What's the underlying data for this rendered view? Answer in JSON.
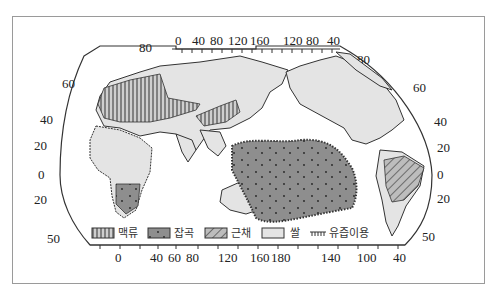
{
  "map": {
    "title": "",
    "projection": "interrupted world map (Eurasia/Africa/Oceania left, Americas right)",
    "top_longitude_ticks_left": [
      "0",
      "40",
      "80",
      "120",
      "160"
    ],
    "top_longitude_ticks_right": [
      "120",
      "80",
      "40"
    ],
    "bottom_longitude_ticks": [
      "0",
      "40",
      "60",
      "80",
      "120",
      "160",
      "180",
      "140",
      "100",
      "40"
    ],
    "left_latitude_labels": [
      "80",
      "60",
      "40",
      "20",
      "0",
      "20",
      "50"
    ],
    "right_latitude_labels": [
      "80",
      "60",
      "40",
      "20",
      "0",
      "20",
      "50"
    ]
  },
  "legend": {
    "items": [
      {
        "id": "wheat",
        "label": "맥류",
        "pattern": "vertical-stripes"
      },
      {
        "id": "grain",
        "label": "잡곡",
        "pattern": "dotted-dark"
      },
      {
        "id": "root",
        "label": "근채",
        "pattern": "diagonal-stripes"
      },
      {
        "id": "rice",
        "label": "쌀",
        "pattern": "light-gray"
      },
      {
        "id": "dairy",
        "label": "유즙이용",
        "pattern": "hatched-line"
      }
    ]
  },
  "colors": {
    "land": "#e4e4e4",
    "outline": "#333333",
    "grain_fill": "#8e8e8e",
    "frame": "#9a9a9a"
  }
}
